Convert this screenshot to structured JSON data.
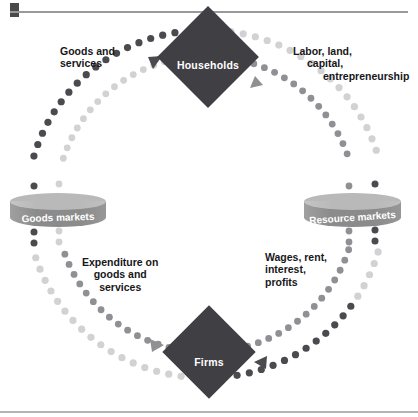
{
  "figure": {
    "kind": "circular-flow-diagram",
    "nodes": {
      "households": "Households",
      "firms": "Firms",
      "goods_markets": "Goods markets",
      "resource_markets": "Resource markets"
    },
    "flow_labels": {
      "goods_and_services": {
        "line1": "Goods  and",
        "line2": "services"
      },
      "labor_land_capital": {
        "line1": "Labor, land,",
        "line2": "capital,",
        "line3": "entrepreneurship"
      },
      "expenditure": {
        "line1": "Expenditure on",
        "line2": "goods and",
        "line3": "services"
      },
      "wages_rent": {
        "line1": "Wages, rent,",
        "line2": "interest,",
        "line3": "profits"
      }
    },
    "colors": {
      "node_fill": "#3f3f44",
      "node_text": "#ffffff",
      "cylinder_body": "#8b8b8b",
      "cylinder_top": "#b9b9b9",
      "dots_dark": "#4a4a4f",
      "dots_medium": "#8f8f94",
      "dots_light": "#d2d2d4",
      "label_text": "#17171a",
      "rule": "#9a9a9a"
    },
    "arrows": [
      {
        "name": "goods-to-households",
        "into": "Households",
        "tone": "dark",
        "direction": "up-right"
      },
      {
        "name": "resources-to-households",
        "into": "Households",
        "tone": "medium",
        "direction": "up-left"
      },
      {
        "name": "expenditure-to-firms",
        "into": "Firms",
        "tone": "medium",
        "direction": "down-right"
      },
      {
        "name": "wages-to-firms",
        "into": "Firms",
        "tone": "dark",
        "direction": "down-left"
      }
    ]
  }
}
